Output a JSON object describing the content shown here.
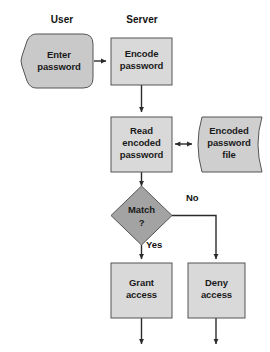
{
  "diagram": {
    "canvas": {
      "width": 270,
      "height": 352,
      "background": "#ffffff"
    },
    "lanes": [
      {
        "id": "user",
        "label": "User",
        "x": 62,
        "y": 23
      },
      {
        "id": "server",
        "label": "Server",
        "x": 142,
        "y": 23
      }
    ],
    "nodes": [
      {
        "id": "enter-password",
        "type": "manual-input",
        "label_lines": [
          "Enter",
          "password"
        ],
        "fill": "#c9c9c9",
        "stroke": "#555555"
      },
      {
        "id": "encode-password",
        "type": "process",
        "label_lines": [
          "Encode",
          "password"
        ],
        "fill": "#d9d9d9",
        "stroke": "#555555"
      },
      {
        "id": "read-encoded-password",
        "type": "process",
        "label_lines": [
          "Read",
          "encoded",
          "password"
        ],
        "fill": "#d9d9d9",
        "stroke": "#555555"
      },
      {
        "id": "encoded-password-file",
        "type": "stored-data",
        "label_lines": [
          "Encoded",
          "password",
          "file"
        ],
        "fill": "#cfcfcf",
        "stroke": "#555555"
      },
      {
        "id": "match-decision",
        "type": "decision",
        "label_lines": [
          "Match",
          "?"
        ],
        "fill": "#a3a3a3",
        "stroke": "#555555"
      },
      {
        "id": "grant-access",
        "type": "process",
        "label_lines": [
          "Grant",
          "access"
        ],
        "fill": "#d9d9d9",
        "stroke": "#555555"
      },
      {
        "id": "deny-access",
        "type": "process",
        "label_lines": [
          "Deny",
          "access"
        ],
        "fill": "#d9d9d9",
        "stroke": "#555555"
      }
    ],
    "edge_labels": [
      {
        "id": "yes-label",
        "text": "Yes",
        "x": 146,
        "y": 248
      },
      {
        "id": "no-label",
        "text": "No",
        "x": 186,
        "y": 201
      }
    ],
    "colors": {
      "connector": "#2b2b2b",
      "text": "#1a1a1a",
      "lane_text": "#121212"
    }
  }
}
